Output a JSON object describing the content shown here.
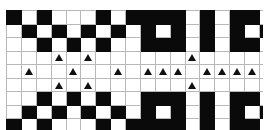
{
  "figure": {
    "rows": 9,
    "cols": 18,
    "colors": {
      "fill": "#0a0a0a",
      "blank": "#ffffff",
      "gridline": "#b8b8b8",
      "border": "#9a9a9a",
      "marker": "#101010"
    },
    "legend": {
      "fill_label": "filled cell",
      "blank_label": "empty cell",
      "marker_label": "triangle marker"
    }
  },
  "chart_data": {
    "type": "heatmap",
    "xlabel": "",
    "ylabel": "",
    "categories": [
      "1",
      "2",
      "3",
      "4",
      "5",
      "6",
      "7",
      "8",
      "9",
      "10",
      "11",
      "12",
      "13",
      "14",
      "15",
      "16",
      "17",
      "18"
    ],
    "row_labels": [
      "1",
      "2",
      "3",
      "4",
      "5",
      "6",
      "7",
      "8",
      "9"
    ],
    "value_legend": {
      "0": "white",
      "1": "black",
      "t": "white cell with triangle marker"
    },
    "matrix": [
      [
        "1",
        "0",
        "1",
        "0",
        "0",
        "0",
        "1",
        "0",
        "1",
        "1",
        "1",
        "1",
        "0",
        "1",
        "0",
        "1",
        "1",
        "0"
      ],
      [
        "0",
        "1",
        "0",
        "1",
        "0",
        "1",
        "0",
        "1",
        "0",
        "1",
        "0",
        "1",
        "0",
        "1",
        "0",
        "1",
        "0",
        "1"
      ],
      [
        "0",
        "0",
        "1",
        "0",
        "1",
        "0",
        "1",
        "0",
        "0",
        "1",
        "1",
        "1",
        "0",
        "1",
        "0",
        "1",
        "1",
        "0"
      ],
      [
        "0",
        "0",
        "0",
        "t",
        "0",
        "t",
        "0",
        "0",
        "0",
        "0",
        "0",
        "0",
        "t",
        "0",
        "0",
        "0",
        "0",
        "0"
      ],
      [
        "0",
        "t",
        "0",
        "0",
        "t",
        "0",
        "0",
        "t",
        "0",
        "t",
        "t",
        "t",
        "0",
        "t",
        "t",
        "t",
        "t",
        "0"
      ],
      [
        "0",
        "0",
        "0",
        "t",
        "0",
        "t",
        "0",
        "0",
        "0",
        "0",
        "0",
        "0",
        "t",
        "0",
        "0",
        "0",
        "0",
        "0"
      ],
      [
        "0",
        "0",
        "1",
        "0",
        "1",
        "0",
        "1",
        "0",
        "0",
        "1",
        "1",
        "1",
        "0",
        "1",
        "0",
        "1",
        "1",
        "0"
      ],
      [
        "0",
        "1",
        "0",
        "1",
        "0",
        "1",
        "0",
        "1",
        "0",
        "1",
        "0",
        "1",
        "0",
        "1",
        "0",
        "1",
        "0",
        "1"
      ],
      [
        "1",
        "0",
        "1",
        "0",
        "0",
        "0",
        "1",
        "0",
        "1",
        "1",
        "1",
        "1",
        "0",
        "1",
        "0",
        "1",
        "1",
        "0"
      ]
    ]
  }
}
